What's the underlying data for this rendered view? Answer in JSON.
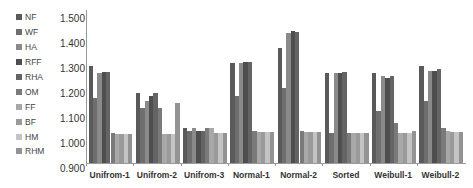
{
  "chart_data": {
    "type": "bar",
    "title": "",
    "xlabel": "",
    "ylabel": "",
    "ylim": [
      0.9,
      1.5
    ],
    "yticks": [
      "0.900",
      "1.000",
      "1.100",
      "1.200",
      "1.300",
      "1.400",
      "1.500"
    ],
    "grid": false,
    "legend_position": "left",
    "categories": [
      "Unifrom-1",
      "Unifrom-2",
      "Unifrom-3",
      "Normal-1",
      "Normal-2",
      "Sorted",
      "Weibull-1",
      "Weibull-2"
    ],
    "series": [
      {
        "name": "NF",
        "color": "#5a5a5a",
        "values": [
          1.29,
          1.18,
          1.04,
          1.3,
          1.36,
          1.26,
          1.26,
          1.29
        ]
      },
      {
        "name": "WF",
        "color": "#6e6e6e",
        "values": [
          1.16,
          1.12,
          1.03,
          1.17,
          1.2,
          1.02,
          1.11,
          1.15
        ]
      },
      {
        "name": "HA",
        "color": "#8a8a8a",
        "values": [
          1.26,
          1.15,
          1.04,
          1.3,
          1.42,
          1.26,
          1.25,
          1.27
        ]
      },
      {
        "name": "RFF",
        "color": "#4e4e4e",
        "values": [
          1.265,
          1.17,
          1.03,
          1.305,
          1.43,
          1.26,
          1.24,
          1.27
        ]
      },
      {
        "name": "RHA",
        "color": "#646464",
        "values": [
          1.265,
          1.18,
          1.03,
          1.305,
          1.425,
          1.265,
          1.25,
          1.275
        ]
      },
      {
        "name": "OM",
        "color": "#7a7a7a",
        "values": [
          1.02,
          1.12,
          1.04,
          1.03,
          1.03,
          1.02,
          1.06,
          1.04
        ]
      },
      {
        "name": "FF",
        "color": "#a8a8a8",
        "values": [
          1.015,
          1.015,
          1.04,
          1.025,
          1.025,
          1.02,
          1.02,
          1.03
        ]
      },
      {
        "name": "BF",
        "color": "#9a9a9a",
        "values": [
          1.015,
          1.015,
          1.02,
          1.025,
          1.025,
          1.02,
          1.02,
          1.025
        ]
      },
      {
        "name": "HM",
        "color": "#c4c4c4",
        "values": [
          1.015,
          1.015,
          1.02,
          1.025,
          1.025,
          1.02,
          1.02,
          1.025
        ]
      },
      {
        "name": "RHM",
        "color": "#939393",
        "values": [
          1.015,
          1.14,
          1.02,
          1.025,
          1.025,
          1.02,
          1.03,
          1.025
        ]
      }
    ]
  }
}
